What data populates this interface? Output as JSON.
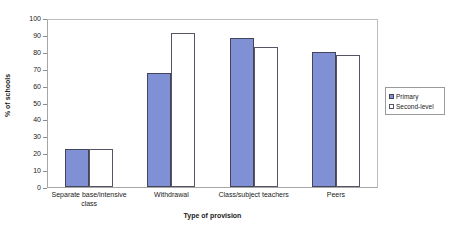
{
  "chart_data": {
    "type": "bar",
    "title": "",
    "xlabel": "Type of provision",
    "ylabel": "% of schools",
    "ylim": [
      0,
      100
    ],
    "yticks": [
      0,
      10,
      20,
      30,
      40,
      50,
      60,
      70,
      80,
      90,
      100
    ],
    "ytick_labels": [
      "0",
      "10",
      "20",
      "30",
      "40",
      "50",
      "60",
      "70",
      "80",
      "90",
      "100"
    ],
    "grid": false,
    "legend_position": "right",
    "categories": [
      "Separate base/intensive class",
      "Withdrawal",
      "Class/subject teachers",
      "Peers"
    ],
    "series": [
      {
        "name": "Primary",
        "color": "#8090d4",
        "values": [
          23,
          68,
          89,
          81
        ]
      },
      {
        "name": "Second-level",
        "color": "#ffffff",
        "values": [
          23,
          92,
          84,
          79
        ]
      }
    ]
  }
}
